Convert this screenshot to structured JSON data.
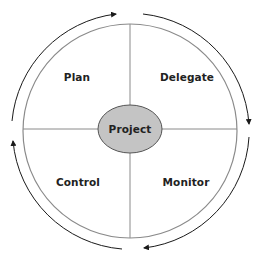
{
  "diagram": {
    "center_label": "Project",
    "quadrants": [
      {
        "position": "top-left",
        "label": "Plan"
      },
      {
        "position": "top-right",
        "label": "Delegate"
      },
      {
        "position": "bottom-right",
        "label": "Monitor"
      },
      {
        "position": "bottom-left",
        "label": "Control"
      }
    ],
    "cycle_direction": "clockwise",
    "colors": {
      "circle_stroke": "#8a8a8a",
      "center_fill": "#c4c4c4",
      "center_stroke": "#555555",
      "arrow": "#1a1a1a",
      "text": "#222222"
    }
  }
}
